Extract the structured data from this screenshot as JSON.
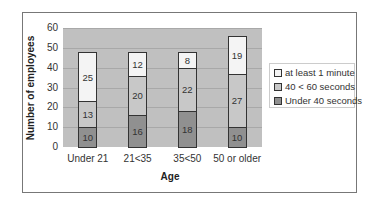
{
  "chart_data": {
    "type": "bar",
    "stacked": true,
    "title": "",
    "xlabel": "Age",
    "ylabel": "Number of employees",
    "ylim": [
      0,
      60
    ],
    "yticks": [
      0,
      10,
      20,
      30,
      40,
      50,
      60
    ],
    "categories": [
      "Under 21",
      "21<35",
      "35<50",
      "50 or older"
    ],
    "series": [
      {
        "name": "Under 40 seconds",
        "color": "#909090",
        "values": [
          10,
          16,
          18,
          10
        ]
      },
      {
        "name": "40 < 60 seconds",
        "color": "#c8c8c8",
        "values": [
          13,
          20,
          22,
          27
        ]
      },
      {
        "name": "at least 1 minute",
        "color": "#f4f4f4",
        "values": [
          25,
          12,
          8,
          19
        ]
      }
    ],
    "legend_order": [
      "at least 1 minute",
      "40 < 60 seconds",
      "Under 40 seconds"
    ],
    "legend_position": "right",
    "grid": true
  }
}
